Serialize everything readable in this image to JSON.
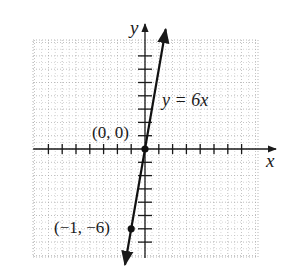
{
  "chart_data": {
    "type": "line",
    "title": "",
    "xlabel": "x",
    "ylabel": "y",
    "equation_label": "y = 6x",
    "series": [
      {
        "name": "y = 6x",
        "x": [
          -1,
          0
        ],
        "y": [
          -6,
          0
        ],
        "slope": 6,
        "intercept": 0,
        "arrows_both_ends": true
      }
    ],
    "points": [
      {
        "x": 0,
        "y": 0,
        "label": "(0, 0)"
      },
      {
        "x": -1,
        "y": -6,
        "label": "(−1, −6)"
      }
    ],
    "x_ticks": [
      -7,
      -6,
      -5,
      -4,
      -3,
      -2,
      -1,
      1,
      2,
      3,
      4,
      5,
      6,
      7
    ],
    "y_ticks": [
      -7,
      -6,
      -5,
      -4,
      -3,
      -2,
      -1,
      1,
      2,
      3,
      4,
      5,
      6,
      7
    ],
    "x_tick_unit": 1,
    "y_tick_unit": 1,
    "grid": true,
    "grid_style": "dotted",
    "tick_labels_shown": false
  },
  "labels": {
    "x_axis": "x",
    "y_axis": "y",
    "equation": "y = 6x",
    "origin": "(0, 0)",
    "point": "(−1, −6)"
  },
  "colors": {
    "line": "#111111",
    "axis": "#1a1a1a",
    "grid": "#9a9a9a",
    "background": "#ffffff"
  }
}
